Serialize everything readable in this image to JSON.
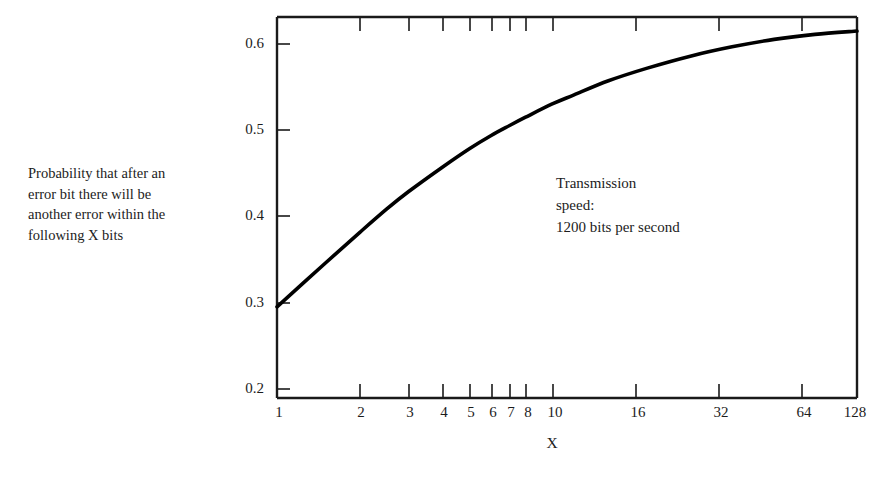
{
  "chart_data": {
    "type": "line",
    "title": "",
    "xlabel": "X",
    "ylabel": "",
    "caption": "Probability that after an\nerror bit there will be\nanother error within the\nfollowing X bits",
    "annotation": "Transmission\nspeed:\n1200 bits per second",
    "x_scale": "log2",
    "xlim": [
      1,
      128
    ],
    "ylim": [
      0.155,
      0.615
    ],
    "grid": false,
    "legend": null,
    "x_ticks": [
      1,
      2,
      3,
      4,
      5,
      6,
      7,
      8,
      10,
      16,
      32,
      64,
      128
    ],
    "x_tick_labels": [
      "1",
      "2",
      "3",
      "4",
      "5",
      "6",
      "7",
      "8",
      "10",
      "16",
      "32",
      "64",
      "128"
    ],
    "y_ticks": [
      0.2,
      0.3,
      0.4,
      0.5,
      0.6
    ],
    "y_tick_labels": [
      "0.2",
      "0.3",
      "0.4",
      "0.5",
      "0.6"
    ],
    "x": [
      1,
      1.5,
      2,
      2.5,
      3,
      4,
      5,
      6,
      7,
      8,
      10,
      12,
      16,
      22,
      32,
      45,
      64,
      90,
      128
    ],
    "y": [
      0.265,
      0.318,
      0.355,
      0.383,
      0.404,
      0.434,
      0.456,
      0.472,
      0.484,
      0.494,
      0.51,
      0.521,
      0.538,
      0.553,
      0.568,
      0.579,
      0.588,
      0.594,
      0.598
    ],
    "series_name": "probability",
    "line_color": "#000000",
    "axis_color": "#1a1a1a"
  },
  "figure": {
    "background": "#ffffff",
    "width": 884,
    "height": 478
  }
}
